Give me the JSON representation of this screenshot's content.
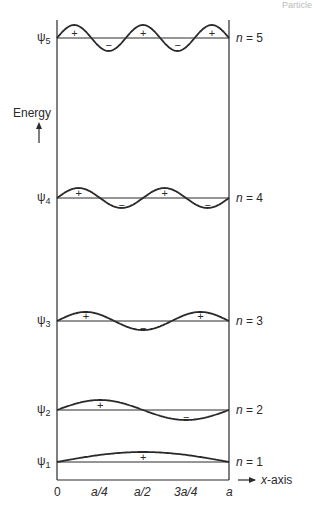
{
  "header_fragment": "Particle",
  "y_axis_label": "Energy",
  "x_axis_label": "x-axis",
  "x_ticks": [
    "0",
    "a/4",
    "a/2",
    "3a/4",
    "a"
  ],
  "levels": [
    {
      "psi": "ψ",
      "sub": "5",
      "n_label": "n",
      "eq": " = 5",
      "n": 5,
      "signs": [
        "+",
        "−",
        "+",
        "−",
        "+"
      ]
    },
    {
      "psi": "ψ",
      "sub": "4",
      "n_label": "n",
      "eq": " = 4",
      "n": 4,
      "signs": [
        "+",
        "−",
        "+",
        "−"
      ]
    },
    {
      "psi": "ψ",
      "sub": "3",
      "n_label": "n",
      "eq": " = 3",
      "n": 3,
      "signs": [
        "+",
        "−",
        "+"
      ]
    },
    {
      "psi": "ψ",
      "sub": "2",
      "n_label": "n",
      "eq": " = 2",
      "n": 2,
      "signs": [
        "+",
        "−"
      ]
    },
    {
      "psi": "ψ",
      "sub": "1",
      "n_label": "n",
      "eq": " = 1",
      "n": 1,
      "signs": [
        "+"
      ]
    }
  ],
  "colors": {
    "line": "#2a2a2a"
  }
}
